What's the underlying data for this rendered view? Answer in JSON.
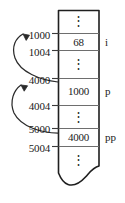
{
  "figure": {
    "ink_color": "#2b2b2b",
    "cell_border_color": "#6e6e6e",
    "outer_border_color": "#1f1f1f",
    "background": "#ffffff"
  },
  "addresses": [
    {
      "id": "addr-1000",
      "text": "1000",
      "x": 16,
      "y": 30
    },
    {
      "id": "addr-1004",
      "text": "1004",
      "x": 16,
      "y": 47
    },
    {
      "id": "addr-4000",
      "text": "4000",
      "x": 16,
      "y": 75
    },
    {
      "id": "addr-4004",
      "text": "4004",
      "x": 16,
      "y": 101
    },
    {
      "id": "addr-5000",
      "text": "5000",
      "x": 16,
      "y": 124
    },
    {
      "id": "addr-5004",
      "text": "5004",
      "x": 16,
      "y": 143
    }
  ],
  "cells": [
    {
      "id": "cell-top-ellipsis",
      "kind": "ellipsis",
      "value": "⋮",
      "top": 10,
      "bottom": 33
    },
    {
      "id": "cell-i-value",
      "kind": "value",
      "value": "68",
      "top": 33,
      "bottom": 50,
      "label": "i"
    },
    {
      "id": "cell-gap-1",
      "kind": "ellipsis",
      "value": "⋮",
      "top": 50,
      "bottom": 78
    },
    {
      "id": "cell-p-value",
      "kind": "value",
      "value": "1000",
      "top": 78,
      "bottom": 105,
      "label": "p"
    },
    {
      "id": "cell-gap-2",
      "kind": "ellipsis",
      "value": "⋮",
      "top": 105,
      "bottom": 128
    },
    {
      "id": "cell-pp-value",
      "kind": "value",
      "value": "4000",
      "top": 128,
      "bottom": 146,
      "label": "pp"
    },
    {
      "id": "cell-bottom-ellipsis",
      "kind": "ellipsis",
      "value": "⋮",
      "top": 146,
      "bottom": 178
    }
  ],
  "cell_values": {
    "top_ellipsis": "⋮",
    "i": "68",
    "gap1_ellipsis": "⋮",
    "p": "1000",
    "gap2_ellipsis": "⋮",
    "pp": "4000",
    "bottom_ellipsis": "⋮"
  },
  "variable_labels": {
    "i": "i",
    "p": "p",
    "pp": "pp"
  },
  "arrows": [
    {
      "id": "arrow-p-to-i",
      "from_address": "4000",
      "to_address": "1000",
      "meaning": "p holds 1000 which points at i"
    },
    {
      "id": "arrow-pp-to-p",
      "from_address": "5000",
      "to_address": "4000",
      "meaning": "pp holds 4000 which points at p"
    }
  ]
}
